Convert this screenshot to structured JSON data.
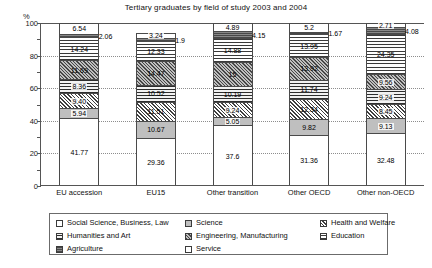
{
  "chart_data": {
    "type": "bar",
    "subtype": "stacked-100-percent",
    "title": "Tertiary graduates by field of study 2003 and 2004",
    "xlabel": "",
    "ylabel": "%",
    "ylim": [
      0,
      100
    ],
    "yticks": [
      0,
      20,
      40,
      60,
      80,
      100
    ],
    "grid": true,
    "legend_position": "bottom",
    "categories": [
      "EU accession",
      "EU15",
      "Other transition",
      "Other OECD",
      "Other non-OECD"
    ],
    "series": [
      {
        "name": "Social Science, Business, Law",
        "fill": "fill-social",
        "values": [
          41.77,
          29.36,
          37.6,
          31.36,
          32.48
        ]
      },
      {
        "name": "Science",
        "fill": "fill-science",
        "values": [
          5.94,
          10.67,
          5.05,
          9.82,
          9.13
        ]
      },
      {
        "name": "Health and Welfare",
        "fill": "fill-health",
        "values": [
          9.4,
          11.51,
          9.24,
          12.34,
          8.45
        ]
      },
      {
        "name": "Humanities and Art",
        "fill": "fill-humanities",
        "values": [
          8.36,
          10.52,
          10.19,
          11.74,
          9.24
        ]
      },
      {
        "name": "Engineering, Manufacturing",
        "fill": "fill-engineering",
        "values": [
          11.69,
          14.47,
          15,
          13.92,
          9.56
        ]
      },
      {
        "name": "Education",
        "fill": "fill-education",
        "values": [
          14.24,
          12.33,
          14.88,
          13.95,
          24.35
        ]
      },
      {
        "name": "Agriculture",
        "fill": "fill-agriculture",
        "values": [
          2.06,
          1.9,
          4.15,
          1.67,
          4.08
        ]
      },
      {
        "name": "Service",
        "fill": "fill-service",
        "values": [
          6.54,
          3.24,
          4.89,
          5.2,
          2.71
        ]
      }
    ],
    "labels": {
      "EU accession": [
        "41.77",
        "5.94",
        "9.40",
        "8.36",
        "11.69",
        "14.24",
        "2.06",
        "6.54"
      ],
      "EU15": [
        "29.36",
        "10.67",
        "11.51",
        "10.52",
        "14.47",
        "12.33",
        "1.9",
        "3.24"
      ],
      "Other transition": [
        "37.6",
        "5.05",
        "9.24",
        "10.19",
        "15",
        "14.88",
        "4.15",
        "4.89"
      ],
      "Other OECD": [
        "31.36",
        "9.82",
        "12.34",
        "11.74",
        "13.92",
        "13.95",
        "1.67",
        "5.2"
      ],
      "Other non-OECD": [
        "32.48",
        "9.13",
        "8.45",
        "9.24",
        "9.56",
        "24.35",
        "4.08",
        "2.71"
      ]
    },
    "callout_series_index": 6
  },
  "legend": {
    "columns": [
      [
        {
          "label": "Social Science, Business, Law",
          "fill": "fill-social"
        },
        {
          "label": "Humanities and Art",
          "fill": "fill-humanities"
        },
        {
          "label": "Agriculture",
          "fill": "fill-agriculture"
        }
      ],
      [
        {
          "label": "Science",
          "fill": "fill-science"
        },
        {
          "label": "Engineering, Manufacturing",
          "fill": "fill-engineering"
        },
        {
          "label": "Service",
          "fill": "fill-service"
        }
      ],
      [
        {
          "label": "Health and Welfare",
          "fill": "fill-health"
        },
        {
          "label": "Education",
          "fill": "fill-education"
        }
      ]
    ]
  }
}
